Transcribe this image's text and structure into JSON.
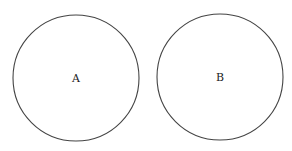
{
  "diagram": {
    "circles": [
      {
        "label": "A",
        "cx": 76,
        "cy": 78,
        "r": 63
      },
      {
        "label": "B",
        "cx": 220,
        "cy": 77,
        "r": 63
      }
    ],
    "stroke_color": "#444444"
  }
}
